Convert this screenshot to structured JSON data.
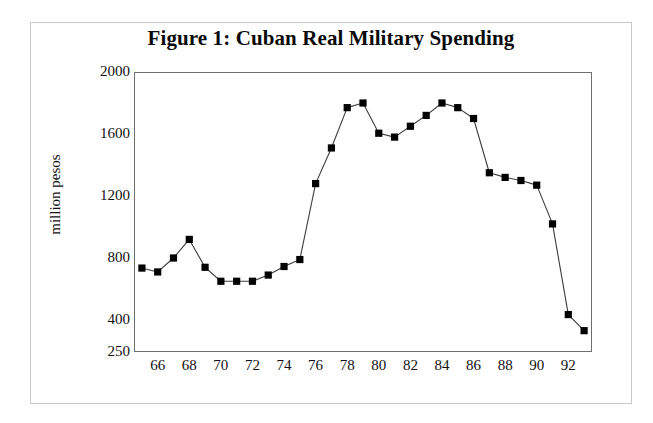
{
  "figure": {
    "title": "Figure 1: Cuban Real Military Spending"
  },
  "chart_data": {
    "type": "line",
    "title": "Figure 1: Cuban Real Military Spending",
    "xlabel": "",
    "ylabel": "million pesos",
    "x": [
      1965,
      1966,
      1967,
      1968,
      1969,
      1970,
      1971,
      1972,
      1973,
      1974,
      1975,
      1976,
      1977,
      1978,
      1979,
      1980,
      1981,
      1982,
      1983,
      1984,
      1985,
      1986,
      1987,
      1988,
      1989,
      1990,
      1991,
      1992,
      1993
    ],
    "x_tick_labels": [
      "66",
      "68",
      "70",
      "72",
      "74",
      "76",
      "78",
      "80",
      "82",
      "84",
      "86",
      "88",
      "90",
      "92"
    ],
    "x_tick_values": [
      1966,
      1968,
      1970,
      1972,
      1974,
      1976,
      1978,
      1980,
      1982,
      1984,
      1986,
      1988,
      1990,
      1992
    ],
    "values": [
      735,
      710,
      800,
      920,
      740,
      650,
      650,
      650,
      690,
      745,
      790,
      1280,
      1510,
      1770,
      1800,
      1605,
      1580,
      1650,
      1720,
      1800,
      1770,
      1700,
      1350,
      1320,
      1300,
      1270,
      1020,
      435,
      350
    ],
    "y_tick_labels": [
      "2000",
      "1600",
      "1200",
      "800",
      "400",
      "250"
    ],
    "y_tick_values": [
      2000,
      1600,
      1200,
      800,
      400,
      250
    ],
    "ylim": [
      250,
      2000
    ],
    "xlim": [
      1964.5,
      1993.5
    ],
    "grid": false,
    "legend": "none",
    "marker": "square",
    "marker_color": "#000000",
    "line_color": "#3c3c3c"
  }
}
